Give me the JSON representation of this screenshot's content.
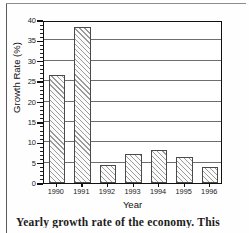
{
  "chart_data": {
    "type": "bar",
    "title": "",
    "xlabel": "Year",
    "ylabel": "Growth Rate (%)",
    "categories": [
      "1990",
      "1991",
      "1992",
      "1993",
      "1994",
      "1995",
      "1996"
    ],
    "values": [
      26.5,
      38.2,
      4.5,
      7.0,
      8.0,
      6.5,
      4.0
    ],
    "ylim": [
      0,
      40
    ],
    "ytick_values": [
      0,
      5,
      10,
      15,
      20,
      25,
      30,
      35,
      40
    ],
    "ytick_labels": [
      "0",
      "5",
      "10",
      "15",
      "20",
      "25",
      "30",
      "35",
      "40"
    ],
    "yminor_interval": 1,
    "grid": "horizontal",
    "legend": "none",
    "bar_fill": "diagonal-hatch",
    "bar_edge_color": "#4a4a4a",
    "axis_color": "#111111",
    "gridline_color": "#6e6e6e"
  },
  "figure": {
    "caption": "Yearly growth rate of the economy. This"
  }
}
